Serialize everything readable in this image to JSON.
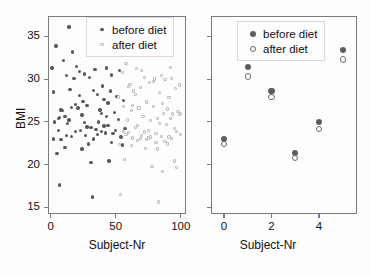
{
  "figure": {
    "background": "#fdfdfd",
    "axis_color": "#7a7d80",
    "before_color": "#58595b",
    "after_color": "#b9bbbd"
  },
  "chart_data": [
    {
      "type": "scatter",
      "panel": "left",
      "title": "",
      "xlabel": "Subject-Nr",
      "ylabel": "BMI",
      "xlim": [
        -2,
        104
      ],
      "ylim": [
        14.2,
        37.4
      ],
      "xticks": [
        0,
        50,
        100
      ],
      "xticklabels": [
        "0",
        "50",
        "100"
      ],
      "yticks": [
        15,
        20,
        25,
        30,
        35
      ],
      "yticklabels": [
        "15",
        "20",
        "25",
        "30",
        "35"
      ],
      "grid": false,
      "legend_position": "top-right",
      "legend": [
        "before diet",
        "after diet"
      ],
      "series": [
        {
          "name": "before diet",
          "marker": "filled-dot",
          "color": "#58595b",
          "points": [
            [
              1,
              31.3
            ],
            [
              2,
              28.5
            ],
            [
              2,
              23.0
            ],
            [
              3,
              25.0
            ],
            [
              4,
              33.9
            ],
            [
              5,
              21.3
            ],
            [
              6,
              25.4
            ],
            [
              6,
              24.0
            ],
            [
              7,
              25.5
            ],
            [
              7,
              17.6
            ],
            [
              8,
              22.9
            ],
            [
              9,
              26.3
            ],
            [
              10,
              32.2
            ],
            [
              11,
              25.6
            ],
            [
              12,
              30.4
            ],
            [
              13,
              24.8
            ],
            [
              14,
              36.1
            ],
            [
              15,
              28.8
            ],
            [
              16,
              26.7
            ],
            [
              17,
              33.2
            ],
            [
              18,
              30.1
            ],
            [
              19,
              23.9
            ],
            [
              20,
              31.5
            ],
            [
              21,
              26.6
            ],
            [
              22,
              28.1
            ],
            [
              23,
              24.0
            ],
            [
              24,
              21.8
            ],
            [
              25,
              27.4
            ],
            [
              26,
              30.6
            ],
            [
              27,
              23.4
            ],
            [
              28,
              26.9
            ],
            [
              29,
              22.4
            ],
            [
              30,
              30.2
            ],
            [
              31,
              20.2
            ],
            [
              32,
              16.2
            ],
            [
              33,
              28.7
            ],
            [
              34,
              31.1
            ],
            [
              35,
              24.1
            ],
            [
              36,
              28.2
            ],
            [
              37,
              25.0
            ],
            [
              38,
              26.4
            ],
            [
              39,
              23.9
            ],
            [
              40,
              29.2
            ],
            [
              41,
              27.6
            ],
            [
              42,
              23.7
            ],
            [
              43,
              31.3
            ],
            [
              44,
              24.6
            ],
            [
              45,
              20.4
            ],
            [
              46,
              28.6
            ],
            [
              47,
              30.5
            ],
            [
              48,
              23.6
            ],
            [
              49,
              26.1
            ],
            [
              50,
              24.0
            ],
            [
              51,
              28.0
            ],
            [
              52,
              25.3
            ],
            [
              53,
              31.0
            ],
            [
              54,
              23.2
            ],
            [
              55,
              22.3
            ],
            [
              56,
              27.5
            ],
            [
              57,
              24.2
            ],
            [
              12,
              23.4
            ],
            [
              16,
              23.3
            ],
            [
              19,
              27.0
            ],
            [
              24,
              25.8
            ],
            [
              28,
              24.4
            ],
            [
              31,
              24.3
            ],
            [
              36,
              23.5
            ],
            [
              39,
              26.0
            ],
            [
              41,
              24.5
            ],
            [
              44,
              27.2
            ],
            [
              8,
              26.4
            ],
            [
              11,
              22.0
            ],
            [
              14,
              25.2
            ],
            [
              22,
              30.9
            ],
            [
              26,
              24.9
            ],
            [
              33,
              23.0
            ],
            [
              43,
              25.6
            ],
            [
              47,
              22.6
            ]
          ]
        },
        {
          "name": "after diet",
          "marker": "open-square",
          "color": "#b9bbbd",
          "points": [
            [
              51,
              32.8
            ],
            [
              52,
              27.9
            ],
            [
              53,
              22.3
            ],
            [
              54,
              16.5
            ],
            [
              55,
              30.8
            ],
            [
              56,
              23.9
            ],
            [
              57,
              20.6
            ],
            [
              58,
              31.8
            ],
            [
              59,
              25.2
            ],
            [
              60,
              23.7
            ],
            [
              61,
              29.4
            ],
            [
              62,
              26.3
            ],
            [
              63,
              23.1
            ],
            [
              64,
              28.6
            ],
            [
              65,
              24.3
            ],
            [
              66,
              31.2
            ],
            [
              67,
              22.8
            ],
            [
              68,
              26.6
            ],
            [
              69,
              29.0
            ],
            [
              70,
              23.4
            ],
            [
              71,
              25.6
            ],
            [
              72,
              30.2
            ],
            [
              73,
              21.9
            ],
            [
              74,
              27.3
            ],
            [
              75,
              24.0
            ],
            [
              76,
              29.6
            ],
            [
              77,
              23.2
            ],
            [
              78,
              19.8
            ],
            [
              79,
              26.8
            ],
            [
              80,
              30.0
            ],
            [
              81,
              22.6
            ],
            [
              82,
              25.4
            ],
            [
              83,
              15.6
            ],
            [
              84,
              28.4
            ],
            [
              85,
              23.3
            ],
            [
              86,
              19.2
            ],
            [
              87,
              26.0
            ],
            [
              88,
              29.9
            ],
            [
              89,
              24.7
            ],
            [
              90,
              22.4
            ],
            [
              91,
              27.8
            ],
            [
              92,
              31.4
            ],
            [
              93,
              23.0
            ],
            [
              94,
              25.9
            ],
            [
              95,
              20.4
            ],
            [
              96,
              28.9
            ],
            [
              97,
              19.6
            ],
            [
              98,
              26.2
            ],
            [
              99,
              29.3
            ],
            [
              100,
              23.5
            ],
            [
              58,
              23.5
            ],
            [
              60,
              29.1
            ],
            [
              62,
              22.2
            ],
            [
              65,
              28.2
            ],
            [
              67,
              24.6
            ],
            [
              70,
              31.0
            ],
            [
              72,
              23.8
            ],
            [
              74,
              22.9
            ],
            [
              77,
              25.1
            ],
            [
              79,
              29.7
            ],
            [
              81,
              23.6
            ],
            [
              84,
              24.8
            ],
            [
              86,
              27.1
            ],
            [
              88,
              22.7
            ],
            [
              90,
              26.5
            ],
            [
              93,
              30.1
            ],
            [
              95,
              24.2
            ],
            [
              97,
              23.9
            ],
            [
              99,
              25.8
            ],
            [
              56,
              26.8
            ],
            [
              63,
              26.9
            ],
            [
              69,
              23.0
            ],
            [
              75,
              23.1
            ],
            [
              82,
              21.8
            ],
            [
              91,
              23.2
            ],
            [
              85,
              30.4
            ],
            [
              92,
              25.4
            ],
            [
              100,
              26.0
            ]
          ]
        }
      ]
    },
    {
      "type": "scatter",
      "panel": "right",
      "title": "",
      "xlabel": "Subject-Nr",
      "ylabel": "",
      "xlim": [
        -0.55,
        5.6
      ],
      "ylim": [
        14.2,
        37.4
      ],
      "xticks": [
        0,
        2,
        4
      ],
      "xticklabels": [
        "0",
        "2",
        "4"
      ],
      "yticks": [
        15,
        20,
        25,
        30,
        35
      ],
      "yticklabels": [
        "",
        "",
        "",
        "",
        ""
      ],
      "grid": false,
      "legend_position": "top-center",
      "legend": [
        "before diet",
        "after diet"
      ],
      "series": [
        {
          "name": "before diet",
          "marker": "filled-circle",
          "color": "#5c5d5f",
          "points": [
            [
              0,
              23.0
            ],
            [
              1,
              31.4
            ],
            [
              2,
              28.6
            ],
            [
              3,
              21.3
            ],
            [
              4,
              25.0
            ],
            [
              5,
              33.4
            ]
          ]
        },
        {
          "name": "after diet",
          "marker": "open-circle",
          "color": "#6b6c6e",
          "points": [
            [
              0,
              22.4
            ],
            [
              1,
              30.3
            ],
            [
              2,
              27.9
            ],
            [
              3,
              20.8
            ],
            [
              4,
              24.2
            ],
            [
              5,
              32.3
            ]
          ]
        }
      ]
    }
  ]
}
